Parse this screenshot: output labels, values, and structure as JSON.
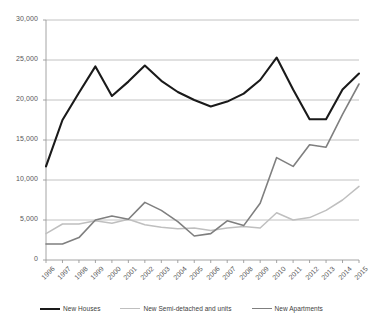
{
  "chart_data": {
    "type": "line",
    "title": "",
    "subtitle": "",
    "xlabel": "",
    "ylabel": "",
    "grid": true,
    "legend_position": "bottom",
    "xlim": [
      1996,
      2015
    ],
    "ylim": [
      0,
      30000
    ],
    "categories": [
      "1996",
      "1997",
      "1998",
      "1999",
      "2000",
      "2001",
      "2002",
      "2003",
      "2004",
      "2005",
      "2006",
      "2007",
      "2008",
      "2009",
      "2010",
      "2011",
      "2012",
      "2013",
      "2014",
      "2015"
    ],
    "x_tick_labels": [
      "1996",
      "1997",
      "1998",
      "1999",
      "2000",
      "2001",
      "2002",
      "2003",
      "2004",
      "2005",
      "2006",
      "2007",
      "2008",
      "2009",
      "2010",
      "2011",
      "2012",
      "2013",
      "2014",
      "2015"
    ],
    "y_tick_labels": [
      "0",
      "5,000",
      "10,000",
      "15,000",
      "20,000",
      "25,000",
      "30,000"
    ],
    "y_tick_values": [
      0,
      5000,
      10000,
      15000,
      20000,
      25000,
      30000
    ],
    "series": [
      {
        "name": "New Houses",
        "color": "#1a1a1a",
        "width": 2.1,
        "values": [
          11700,
          17500,
          20900,
          24200,
          20500,
          22300,
          24300,
          22400,
          21000,
          20000,
          19200,
          19800,
          20800,
          22500,
          25300,
          21300,
          17600,
          17600,
          21300,
          23300
        ]
      },
      {
        "name": "New Semi-detached and units",
        "color": "#bfbfbf",
        "width": 1.5,
        "values": [
          3300,
          4500,
          4500,
          4900,
          4600,
          5100,
          4400,
          4100,
          3900,
          4000,
          3700,
          4000,
          4200,
          4000,
          5900,
          5000,
          5300,
          6200,
          7500,
          9200
        ]
      },
      {
        "name": "New Apartments",
        "color": "#7f7f7f",
        "width": 1.6,
        "values": [
          2000,
          2000,
          2800,
          5000,
          5500,
          5100,
          7200,
          6200,
          4800,
          3000,
          3300,
          4900,
          4300,
          7100,
          12800,
          11700,
          14400,
          14100,
          18200,
          22000
        ]
      }
    ]
  },
  "legend": {
    "items": [
      {
        "label": "New Houses"
      },
      {
        "label": "New Semi-detached and units"
      },
      {
        "label": "New Apartments"
      }
    ]
  },
  "axes": {
    "y_max_label": "30,000",
    "y_min_label": "0"
  }
}
